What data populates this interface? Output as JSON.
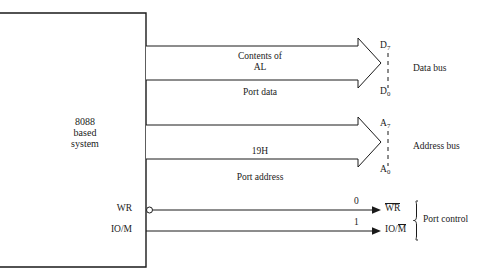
{
  "diagram": {
    "system_block": {
      "line1": "8088",
      "line2": "based",
      "line3": "system"
    },
    "data_bus": {
      "arrow_label_line1": "Contents of",
      "arrow_label_line2": "AL",
      "under_label": "Port data",
      "pin_high_letter": "D",
      "pin_high_index": "7",
      "pin_low_letter": "D",
      "pin_low_index": "0",
      "bus_name": "Data bus"
    },
    "address_bus": {
      "arrow_label": "19H",
      "under_label": "Port address",
      "pin_high_letter": "A",
      "pin_high_index": "7",
      "pin_low_letter": "A",
      "pin_low_index": "0",
      "bus_name": "Address bus"
    },
    "port_control": {
      "group_name": "Port control",
      "signals": [
        {
          "source_label": "WR",
          "value": "0",
          "dest_prefix": "",
          "dest_overbar": "WR",
          "dest_suffix": "",
          "has_bubble": true
        },
        {
          "source_label": "IO/M",
          "value": "1",
          "dest_prefix": "IO/",
          "dest_overbar": "M",
          "dest_suffix": "",
          "has_bubble": false
        }
      ]
    },
    "colors": {
      "line": "#1a1a1a",
      "text": "#1a1a1a",
      "background": "#ffffff"
    }
  }
}
